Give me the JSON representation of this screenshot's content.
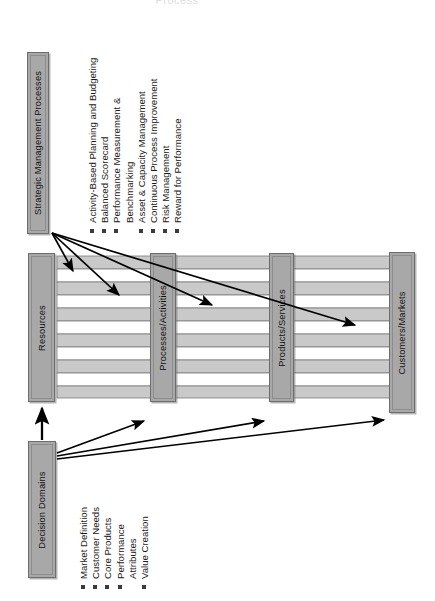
{
  "title_fragment": "Process",
  "diagram": {
    "orientation": "rotated-90-ccw",
    "boxes": {
      "strategic": {
        "label": "Strategic Management Processes"
      },
      "resources": {
        "label": "Resources"
      },
      "processes": {
        "label": "Processes/Activities"
      },
      "products": {
        "label": "Products/Services"
      },
      "customers": {
        "label": "Customers/Markets"
      },
      "decision": {
        "label": "Decision Domains"
      }
    },
    "strategic_items": [
      {
        "text": "Activity-Based Planning and Budgeting",
        "bullet": true
      },
      {
        "text": "Balanced Scorecard",
        "bullet": true
      },
      {
        "text": "Performance Measurement &",
        "bullet": true
      },
      {
        "text": "Benchmarking",
        "bullet": false
      },
      {
        "text": "Asset & Capacity Management",
        "bullet": true
      },
      {
        "text": "Continuous Process Improvement",
        "bullet": true
      },
      {
        "text": "Risk Management",
        "bullet": true
      },
      {
        "text": "Reward for Performance",
        "bullet": true
      }
    ],
    "decision_items": [
      {
        "text": "Market Definition",
        "bullet": true
      },
      {
        "text": "Customer Needs",
        "bullet": true
      },
      {
        "text": "Core Products",
        "bullet": true
      },
      {
        "text": "Performance",
        "bullet": true
      },
      {
        "text": "Attributes",
        "bullet": false
      },
      {
        "text": "Value Creation",
        "bullet": true
      }
    ],
    "colors": {
      "box_fill": "#a8a8a8",
      "box_stroke": "#6d6d6d",
      "band_fill": "#c9c9c9",
      "band_stroke": "#7a7a7a",
      "arrow": "#000000",
      "background": "#ffffff"
    },
    "bands": {
      "count": 10,
      "note": "alternating gray/white horizontal value-chain bands spanning Resources to Customers/Markets"
    },
    "arrows": {
      "from_strategic": 4,
      "from_decision_vertical": 1,
      "from_decision_diagonal": 3
    }
  }
}
